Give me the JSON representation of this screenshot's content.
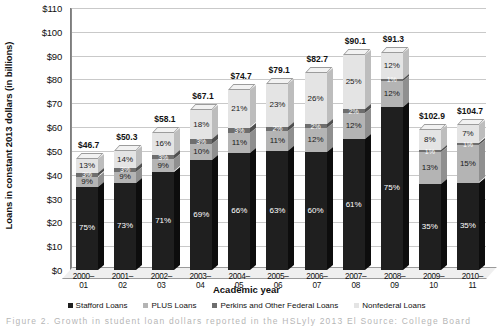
{
  "chart_data": {
    "type": "bar",
    "stacked": true,
    "title": "",
    "xlabel": "Academic year",
    "ylabel": "Loans in constant 2013 dollars (in billions)",
    "ylim": [
      0,
      110
    ],
    "ytick_labels": [
      "$110",
      "$100",
      "$90",
      "$80",
      "$70",
      "$60",
      "$50",
      "$40",
      "$30",
      "$20",
      "$10",
      "$0"
    ],
    "ytick_values": [
      110,
      100,
      90,
      80,
      70,
      60,
      50,
      40,
      30,
      20,
      10,
      0
    ],
    "grid": true,
    "legend_position": "bottom",
    "categories": [
      "2000–01",
      "2001–02",
      "2002–03",
      "2003–04",
      "2004–05",
      "2005–06",
      "2006–07",
      "2007–08",
      "2008–09",
      "2009–10",
      "2010–11"
    ],
    "totals": [
      46.7,
      50.3,
      58.1,
      67.1,
      74.7,
      79.1,
      82.7,
      90.1,
      91.3,
      102.9,
      104.7
    ],
    "total_labels": [
      "$46.7",
      "$50.3",
      "$58.1",
      "$67.1",
      "$74.7",
      "$79.1",
      "$82.7",
      "$90.1",
      "$91.3",
      "$102.9",
      "$104.7"
    ],
    "series": [
      {
        "name": "Stafford Loans",
        "color": "#1f1f1f",
        "pct_labels": [
          "75%",
          "73%",
          "71%",
          "69%",
          "66%",
          "63%",
          "60%",
          "61%",
          "75%",
          "35%",
          "35%"
        ],
        "pct_values": [
          75,
          73,
          71,
          69,
          66,
          63,
          60,
          61,
          75,
          35,
          35
        ]
      },
      {
        "name": "PLUS Loans",
        "color": "#b4b4b4",
        "pct_labels": [
          "9%",
          "9%",
          "9%",
          "10%",
          "11%",
          "11%",
          "12%",
          "12%",
          "12%",
          "13%",
          "15%"
        ],
        "pct_values": [
          9,
          9,
          9,
          10,
          11,
          11,
          12,
          12,
          12,
          13,
          15
        ]
      },
      {
        "name": "Perkins and Other Federal Loans",
        "color": "#6e6e6e",
        "pct_labels": [
          "3%",
          "3%",
          "3%",
          "3%",
          "3%",
          "2%",
          "2%",
          "2%",
          "1%",
          "1%",
          "1%"
        ],
        "pct_values": [
          3,
          3,
          3,
          3,
          3,
          2,
          2,
          2,
          1,
          1,
          1
        ]
      },
      {
        "name": "Nonfederal Loans",
        "color": "#e4e4e4",
        "pct_labels": [
          "13%",
          "14%",
          "16%",
          "18%",
          "21%",
          "23%",
          "26%",
          "25%",
          "12%",
          "8%",
          "7%"
        ],
        "pct_values": [
          13,
          14,
          16,
          18,
          21,
          23,
          26,
          25,
          12,
          8,
          7
        ]
      }
    ]
  },
  "legend": {
    "items": [
      {
        "label": "Stafford Loans",
        "key": "stafford"
      },
      {
        "label": "PLUS Loans",
        "key": "plus"
      },
      {
        "label": "Perkins and Other Federal Loans",
        "key": "perkins"
      },
      {
        "label": "Nonfederal Loans",
        "key": "nonfed"
      }
    ]
  },
  "caption": {
    "text": "Figure 2. Growth in student loan dollars reported in the HSLyly 2013 El Source: College Board 2012"
  }
}
